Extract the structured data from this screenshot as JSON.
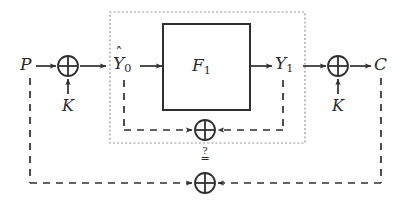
{
  "diagram": {
    "stroke_color": "#2f2f2f",
    "dotted_color": "#8a8a8a",
    "labels": {
      "plaintext": "P",
      "key_left": "K",
      "key_right": "K",
      "y0_base": "Y",
      "y0_sub": "0",
      "y0_hat": "ˆ",
      "function_base": "F",
      "function_sub": "1",
      "y1_base": "Y",
      "y1_sub": "1",
      "ciphertext": "C"
    },
    "comparison": {
      "question": "?",
      "equals": "="
    },
    "nodes": [
      {
        "name": "xor-key-left",
        "x": 68,
        "y": 66,
        "r": 10
      },
      {
        "name": "xor-key-right",
        "x": 338,
        "y": 66,
        "r": 10
      },
      {
        "name": "xor-inner",
        "x": 205,
        "y": 130,
        "r": 10
      },
      {
        "name": "xor-bottom",
        "x": 205,
        "y": 183,
        "r": 10
      }
    ],
    "function_box": {
      "x": 163,
      "y": 24,
      "w": 87,
      "h": 86
    },
    "dotted_region": {
      "x": 110,
      "y": 12,
      "w": 195,
      "h": 131
    }
  }
}
